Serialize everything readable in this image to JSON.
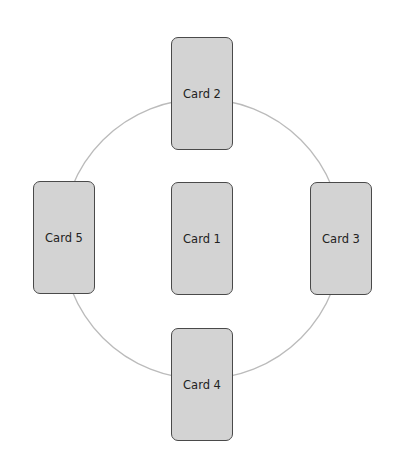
{
  "diagram": {
    "type": "circular-spread",
    "circle": {
      "cx": 202,
      "cy": 239,
      "r": 140,
      "stroke": "#bbbbbb"
    },
    "card_style": {
      "fill": "#d3d3d3",
      "stroke": "#4a4a4a"
    },
    "cards": [
      {
        "label": "Card 1",
        "position": "center",
        "x": 171,
        "y": 182
      },
      {
        "label": "Card 2",
        "position": "top",
        "x": 171,
        "y": 37
      },
      {
        "label": "Card 3",
        "position": "right",
        "x": 310,
        "y": 182
      },
      {
        "label": "Card 4",
        "position": "bottom",
        "x": 171,
        "y": 328
      },
      {
        "label": "Card 5",
        "position": "left",
        "x": 33,
        "y": 181
      }
    ]
  }
}
